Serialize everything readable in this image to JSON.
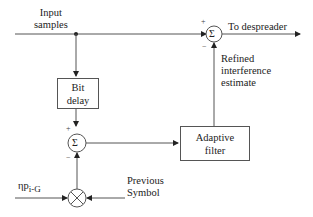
{
  "diagram": {
    "labels": {
      "input": [
        "Input",
        "samples"
      ],
      "output": "To despreader",
      "refined": [
        "Refined",
        "interference",
        "estimate"
      ],
      "previous": [
        "Previous",
        "Symbol"
      ],
      "eta_p": "ηp",
      "eta_sub": "i-G"
    },
    "blocks": {
      "bit_delay": [
        "Bit",
        "delay"
      ],
      "adaptive_filter": [
        "Adaptive",
        "filter"
      ]
    },
    "summers": {
      "top": {
        "symbol": "Σ",
        "plus": "+",
        "minus": "−"
      },
      "middle": {
        "symbol": "Σ",
        "plus": "+",
        "minus": "−"
      }
    },
    "multiplier": {
      "symbol": "⊗"
    }
  }
}
